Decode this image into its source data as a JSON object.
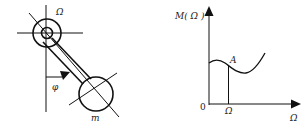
{
  "figure": {
    "left_diagram": {
      "title": "rotating pendulum",
      "labels": {
        "omega": "Ω",
        "phi": "φ",
        "mass": "m"
      }
    },
    "right_diagram": {
      "labels": {
        "y_axis": "M( Ω )",
        "x_axis": "Ω",
        "origin": "0",
        "tick": "Ω",
        "point": "A"
      }
    },
    "stroke_color": "#111111",
    "background": "#ffffff"
  }
}
